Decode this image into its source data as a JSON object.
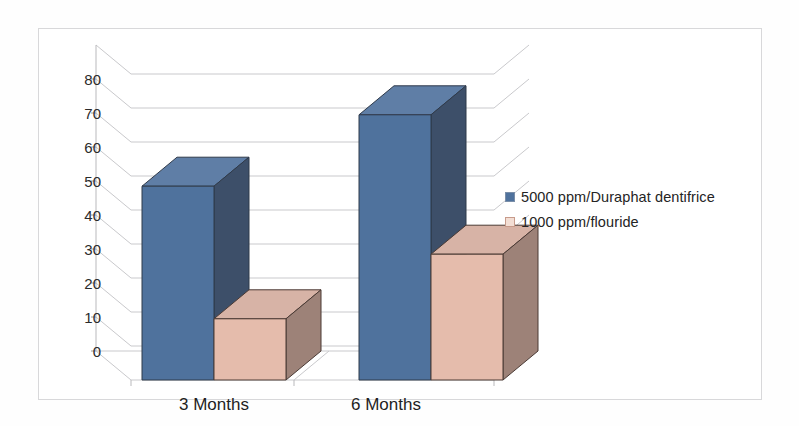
{
  "chart_data": {
    "type": "bar",
    "title": "",
    "subtitle": "",
    "xlabel": "",
    "ylabel": "",
    "categories": [
      "3 Months",
      "6 Months"
    ],
    "series": [
      {
        "name": "5000 ppm/Duraphat dentifrice",
        "values": [
          57,
          78
        ],
        "color": "#4f729d",
        "side_color": "#3d4f69",
        "top_color": "#5f7ea6"
      },
      {
        "name": "1000 ppm/flouride",
        "values": [
          18,
          37
        ],
        "color": "#e5bcac",
        "side_color": "#9d8278",
        "top_color": "#d7b3a6"
      }
    ],
    "ylim": [
      0,
      80
    ],
    "ytick_step": 10,
    "yticks": [
      "0",
      "10",
      "20",
      "30",
      "40",
      "50",
      "60",
      "70",
      "80"
    ],
    "grid": true,
    "legend_position": "right",
    "three_d": true
  },
  "axis": {
    "y_ticks": [
      "80",
      "70",
      "60",
      "50",
      "40",
      "30",
      "20",
      "10",
      "0"
    ],
    "x_labels": [
      "3 Months",
      "6 Months"
    ]
  },
  "legend": {
    "items": [
      {
        "label": "5000 ppm/Duraphat dentifrice",
        "color": "#4f729d",
        "border": "#7a8ea8"
      },
      {
        "label": "1000 ppm/flouride",
        "color": "#f3ded4",
        "border": "#c79b8b"
      }
    ]
  },
  "colors": {
    "grid": "#c9c9cc",
    "frame": "#d8d8da",
    "axis_text": "#2b2b2b",
    "background": "#ffffff"
  }
}
